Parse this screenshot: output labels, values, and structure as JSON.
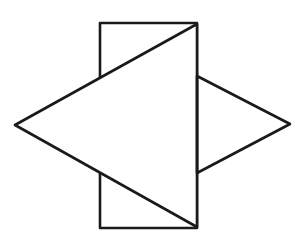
{
  "diagram": {
    "background": "#ffffff",
    "stroke_color": "#1a1a1a",
    "stroke_width": 2.6,
    "shapes": {
      "rectangle": {
        "x": 100,
        "y": 23,
        "width": 97,
        "height": 205
      },
      "left_triangle": {
        "points": "197,24 15,125 197,227"
      },
      "right_triangle": {
        "points": "197,76 290,124 197,173"
      }
    }
  }
}
